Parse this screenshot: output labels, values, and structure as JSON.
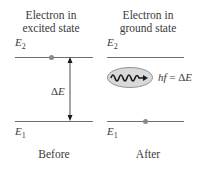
{
  "diagram": {
    "type": "energy-level-transition",
    "panels": [
      {
        "id": "before",
        "title_line1": "Electron in",
        "title_line2": "excited state",
        "upper_level": {
          "symbol": "E",
          "subscript": "2"
        },
        "lower_level": {
          "symbol": "E",
          "subscript": "1"
        },
        "electron_on": "upper",
        "gap_label": {
          "prefix": "Δ",
          "symbol": "E"
        },
        "caption": "Before"
      },
      {
        "id": "after",
        "title_line1": "Electron in",
        "title_line2": "ground state",
        "upper_level": {
          "symbol": "E",
          "subscript": "2"
        },
        "lower_level": {
          "symbol": "E",
          "subscript": "1"
        },
        "electron_on": "lower",
        "photon_label": {
          "lhs": "hf",
          "eq": " = Δ",
          "rhs": "E"
        },
        "caption": "After"
      }
    ],
    "colors": {
      "line": "#6e6e6e",
      "electron": "#8a8a8a",
      "photon_fill": "#d9d9d9",
      "photon_stroke": "#7a7a7a",
      "wave": "#1a1a1a",
      "text": "#3a3a3a"
    }
  }
}
